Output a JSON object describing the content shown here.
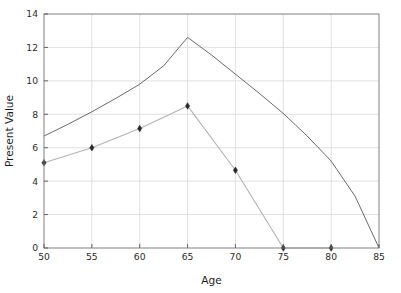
{
  "chart_data": {
    "type": "line",
    "title": "",
    "subtitle": "",
    "xlabel": "Age",
    "ylabel": "Present Value",
    "xlim": [
      50,
      85
    ],
    "ylim": [
      0,
      14
    ],
    "xticks": [
      50,
      55,
      60,
      65,
      70,
      75,
      80,
      85
    ],
    "yticks": [
      0,
      2,
      4,
      6,
      8,
      10,
      12,
      14
    ],
    "xtick_labels": [
      "50",
      "55",
      "60",
      "65",
      "70",
      "75",
      "80",
      "85"
    ],
    "ytick_labels": [
      "0",
      "2",
      "4",
      "6",
      "8",
      "10",
      "12",
      "14"
    ],
    "grid": true,
    "grid_color": "#d9d9d9",
    "legend": null,
    "legend_position": "none",
    "series": [
      {
        "name": "upper-curve",
        "color": "#595959",
        "linewidth": 0.9,
        "marker": "none",
        "x": [
          50,
          52.5,
          55,
          57.5,
          60,
          62.5,
          65,
          67.5,
          70,
          72.5,
          75,
          77.5,
          80,
          82.5,
          85
        ],
        "values": [
          6.7,
          7.4,
          8.15,
          8.95,
          9.8,
          10.9,
          12.6,
          11.55,
          10.4,
          9.25,
          8.05,
          6.7,
          5.2,
          3.1,
          0.0
        ]
      },
      {
        "name": "lower-curve",
        "color": "#b3b3b3",
        "linewidth": 1.1,
        "marker": "diamond",
        "marker_color": "#262626",
        "x": [
          50,
          55,
          60,
          65,
          70,
          75,
          80
        ],
        "values": [
          5.1,
          6.0,
          7.15,
          8.5,
          4.65,
          0.0,
          0.0
        ]
      }
    ],
    "data_points": [
      {
        "age": 50,
        "present_value": 5.1
      },
      {
        "age": 55,
        "present_value": 6.0
      },
      {
        "age": 60,
        "present_value": 7.15
      },
      {
        "age": 65,
        "present_value": 8.5
      },
      {
        "age": 70,
        "present_value": 4.65
      },
      {
        "age": 75,
        "present_value": 0.0
      },
      {
        "age": 80,
        "present_value": 0.0
      }
    ],
    "annotations": []
  },
  "figure": {
    "background": "#ffffff",
    "axes_edge_color": "#808080"
  }
}
